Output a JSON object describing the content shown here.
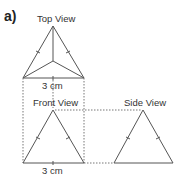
{
  "part_label": "a)",
  "views": {
    "top": {
      "title": "Top View",
      "dimension": "3 cm"
    },
    "front": {
      "title": "Front View",
      "dimension": "3 cm"
    },
    "side": {
      "title": "Side View"
    }
  },
  "colors": {
    "line": "#555555",
    "dotted": "#777777",
    "text": "#333333"
  }
}
